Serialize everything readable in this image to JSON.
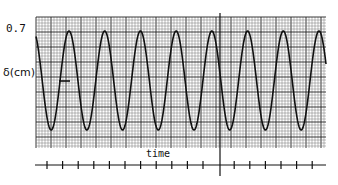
{
  "chart_data": {
    "type": "line",
    "title": "",
    "xlabel": "time",
    "ylabel": "δ(cm)",
    "y_tick_labels": [
      "0.7"
    ],
    "amplitude": 0.7,
    "ylim": [
      -0.75,
      0.75
    ],
    "grid": true,
    "waveform": "sinusoid",
    "cycles_visible": 8,
    "peak_x_px": [
      69,
      105,
      141,
      176,
      212,
      248,
      283,
      319
    ],
    "time_axis_ticks": 18,
    "marker_line_tick_index": 11,
    "series": [
      {
        "name": "δ",
        "description": "sinusoidal displacement, amplitude 0.7 cm"
      }
    ]
  },
  "labels": {
    "y_tick": "0.7",
    "y_axis": "δ(cm)",
    "x_axis": "time"
  }
}
